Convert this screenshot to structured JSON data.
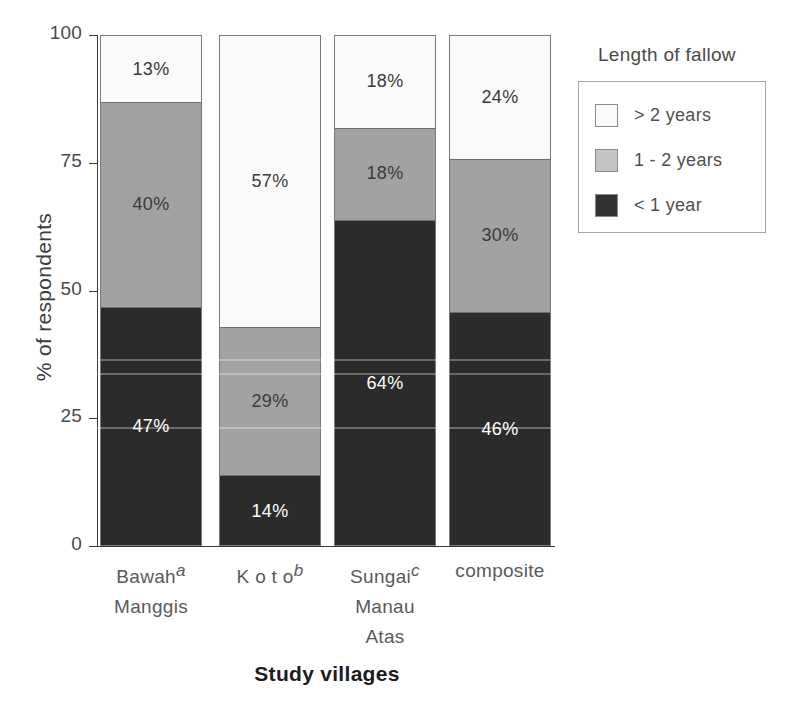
{
  "chart_data": {
    "type": "bar",
    "subtype": "stacked-bar-100",
    "title": "",
    "xlabel": "Study villages",
    "ylabel": "% of respondents",
    "ylim": [
      0,
      100
    ],
    "yticks": [
      0,
      25,
      50,
      75,
      100
    ],
    "ytick_labels": [
      "0",
      "25",
      "50",
      "75",
      "100"
    ],
    "grid": false,
    "categories": [
      "Bawah Manggis",
      "K o t o",
      "Sungai Manau Atas",
      "composite"
    ],
    "category_superscripts": [
      "a",
      "b",
      "c",
      ""
    ],
    "category_lines": [
      [
        "Bawah",
        "Manggis"
      ],
      [
        "K o t o"
      ],
      [
        "Sungai",
        "Manau",
        "Atas"
      ],
      [
        "composite"
      ]
    ],
    "legend_title": "Length of fallow",
    "legend_position": "right",
    "series": [
      {
        "name": "> 2  years",
        "key": "gt2",
        "color": "#fafafa",
        "values": [
          13,
          57,
          18,
          24
        ]
      },
      {
        "name": "1 - 2 years",
        "key": "one_to_two",
        "color": "#a2a2a2",
        "values": [
          40,
          29,
          18,
          30
        ]
      },
      {
        "name": "< 1 year",
        "key": "lt1",
        "color": "#2b2b2b",
        "values": [
          47,
          14,
          64,
          46
        ]
      }
    ],
    "data_labels": [
      {
        "category": "Bawah Manggis",
        "series": "> 2  years",
        "text": "13%"
      },
      {
        "category": "Bawah Manggis",
        "series": "1 - 2 years",
        "text": "40%"
      },
      {
        "category": "Bawah Manggis",
        "series": "< 1 year",
        "text": "47%"
      },
      {
        "category": "K o t o",
        "series": "> 2  years",
        "text": "57%"
      },
      {
        "category": "K o t o",
        "series": "1 - 2 years",
        "text": "29%"
      },
      {
        "category": "K o t o",
        "series": "< 1 year",
        "text": "14%"
      },
      {
        "category": "Sungai Manau Atas",
        "series": "> 2  years",
        "text": "18%"
      },
      {
        "category": "Sungai Manau Atas",
        "series": "1 - 2 years",
        "text": "18%"
      },
      {
        "category": "Sungai Manau Atas",
        "series": "< 1 year",
        "text": "64%"
      },
      {
        "category": "composite",
        "series": "> 2  years",
        "text": "24%"
      },
      {
        "category": "composite",
        "series": "1 - 2 years",
        "text": "30%"
      },
      {
        "category": "composite",
        "series": "< 1 year",
        "text": "46%"
      }
    ]
  },
  "axes": {
    "y_title": "% of respondents",
    "x_title": "Study villages",
    "y_ticks": [
      {
        "value": "100"
      },
      {
        "value": "75"
      },
      {
        "value": "50"
      },
      {
        "value": "25"
      },
      {
        "value": "0"
      }
    ]
  },
  "legend": {
    "title": "Length of fallow",
    "items": [
      {
        "label": "> 2  years",
        "swatch": "light"
      },
      {
        "label": "1 - 2 years",
        "swatch": "mid"
      },
      {
        "label": "< 1 year",
        "swatch": "dark"
      }
    ]
  },
  "bars": [
    {
      "name": "bawah-manggis",
      "line1": "Bawah",
      "line2": "Manggis",
      "line3": "",
      "sup": "a",
      "segments": [
        {
          "cls": "light",
          "label": "13%"
        },
        {
          "cls": "mid",
          "label": "40%"
        },
        {
          "cls": "dark",
          "label": "47%"
        }
      ]
    },
    {
      "name": "koto",
      "line1": "K o t o",
      "line2": "",
      "line3": "",
      "sup": "b",
      "segments": [
        {
          "cls": "light",
          "label": "57%"
        },
        {
          "cls": "mid",
          "label": "29%"
        },
        {
          "cls": "dark",
          "label": "14%"
        }
      ]
    },
    {
      "name": "sungai-manau-atas",
      "line1": "Sungai",
      "line2": "Manau",
      "line3": "Atas",
      "sup": "c",
      "segments": [
        {
          "cls": "light",
          "label": "18%"
        },
        {
          "cls": "mid",
          "label": "18%"
        },
        {
          "cls": "dark",
          "label": "64%"
        }
      ]
    },
    {
      "name": "composite",
      "line1": "composite",
      "line2": "",
      "line3": "",
      "sup": "",
      "segments": [
        {
          "cls": "light",
          "label": "24%"
        },
        {
          "cls": "mid",
          "label": "30%"
        },
        {
          "cls": "dark",
          "label": "46%"
        }
      ]
    }
  ],
  "colors": {
    "light": "#fafafa",
    "mid": "#a2a2a2",
    "dark": "#2b2b2b",
    "axis": "#3a3a3a"
  }
}
